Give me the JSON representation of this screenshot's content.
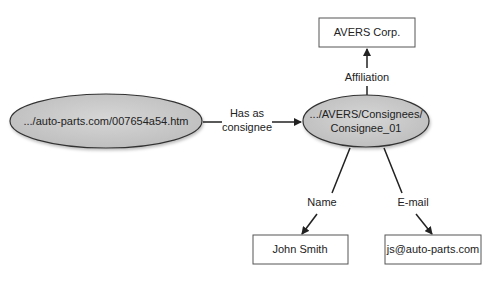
{
  "diagram": {
    "nodes": {
      "resource": {
        "label": ".../auto-parts.com/007654a54.htm",
        "shape": "ellipse"
      },
      "consignee": {
        "label_line1": ".../AVERS/Consignees/",
        "label_line2": "Consignee_01",
        "shape": "ellipse"
      },
      "avers": {
        "label": "AVERS Corp.",
        "shape": "rect"
      },
      "name": {
        "label": "John Smith",
        "shape": "rect"
      },
      "email": {
        "label": "js@auto-parts.com",
        "shape": "rect"
      }
    },
    "edges": {
      "has_consignee": {
        "line1": "Has as",
        "line2": "consignee"
      },
      "affiliation": {
        "label": "Affiliation"
      },
      "name": {
        "label": "Name"
      },
      "email": {
        "label": "E-mail"
      }
    },
    "colors": {
      "ellipse_fill": "#c8c8c8",
      "stroke": "#333333",
      "box_stroke": "#555555"
    }
  }
}
